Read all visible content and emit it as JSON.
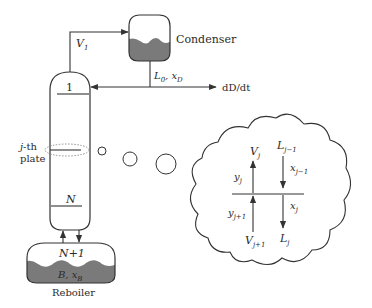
{
  "diagram": {
    "colors": {
      "line": "#333333",
      "liquid_fill": "#7a7a7a",
      "background": "#ffffff",
      "text": "#2a2a2a"
    },
    "condenser": {
      "label": "Condenser"
    },
    "column": {
      "top_plate_label": "1",
      "bottom_plate_label": "N",
      "plate_label_line1": "j-th",
      "plate_label_line2": "plate"
    },
    "streams": {
      "vapor_top": {
        "symbol": "V",
        "subscript": "1"
      },
      "reflux": {
        "symbol": "L",
        "subscript": "0",
        "sep": ", ",
        "comp": "x",
        "comp_sub": "D"
      },
      "distillate": {
        "label": "dD/dt"
      }
    },
    "reboiler": {
      "stage_label": "N+1",
      "holdup_symbol": "B",
      "holdup_sep": ", ",
      "holdup_comp": "x",
      "holdup_comp_sub": "B",
      "label": "Reboiler"
    },
    "plate_detail": {
      "vapor_out": {
        "symbol": "V",
        "subscript": "j"
      },
      "vapor_out_comp": {
        "symbol": "y",
        "subscript": "j"
      },
      "vapor_in": {
        "symbol": "V",
        "subscript": "j+1"
      },
      "vapor_in_comp": {
        "symbol": "y",
        "subscript": "j+1"
      },
      "liquid_in": {
        "symbol": "L",
        "subscript": "j−1"
      },
      "liquid_in_comp": {
        "symbol": "x",
        "subscript": "j−1"
      },
      "liquid_out": {
        "symbol": "L",
        "subscript": "j"
      },
      "liquid_out_comp": {
        "symbol": "x",
        "subscript": "j"
      }
    }
  }
}
